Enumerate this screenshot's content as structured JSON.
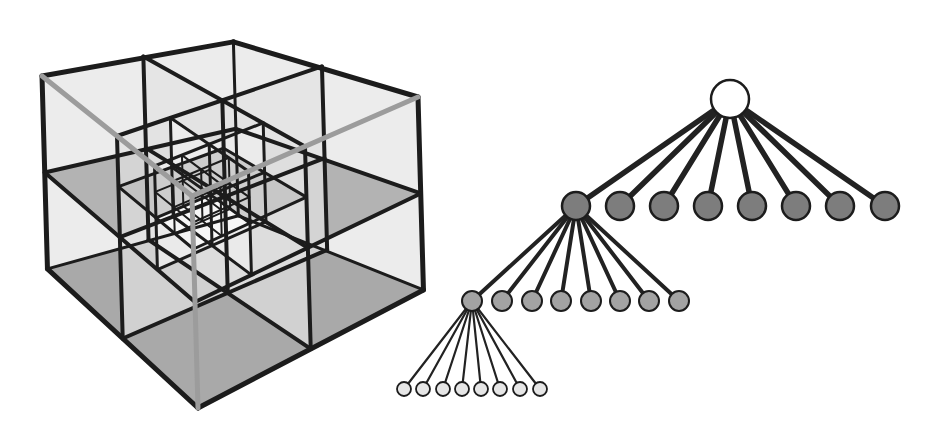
{
  "figure": {
    "colors": {
      "background": "#ffffff",
      "edge_dark": "#1c1c1c",
      "edge_hidden": "#9c9c9c",
      "face_light": "#ececec",
      "face_dark": "#a9a9a9",
      "root_fill": "#ffffff",
      "level1_fill": "#7d7d7d",
      "level2_fill": "#a3a3a3",
      "leaf_fill": "#e6e6e6"
    }
  },
  "cube": {
    "label": "octree-cube",
    "levels": 3,
    "corners": {
      "top_back": [
        241,
        20
      ],
      "left": [
        42,
        76
      ],
      "right": [
        418,
        97
      ],
      "front_top_hidden": [
        192,
        196
      ],
      "left_bottom": [
        78,
        272
      ],
      "right_bottom": [
        378,
        296
      ],
      "bottom": [
        198,
        408
      ]
    }
  },
  "tree": {
    "label": "octree-tree",
    "branching": 8,
    "root": {
      "x": 730,
      "y": 99,
      "r": 19
    },
    "level1": {
      "y": 206,
      "r": 14,
      "x": [
        576,
        620,
        664,
        708,
        752,
        796,
        840,
        885
      ],
      "expanded_index": 0
    },
    "level2": {
      "y": 301,
      "r": 10,
      "x": [
        472,
        502,
        532,
        561,
        591,
        620,
        649,
        679
      ],
      "expanded_index": 0
    },
    "leaves": {
      "y": 389,
      "r": 7,
      "x": [
        404,
        423,
        443,
        462,
        481,
        500,
        520,
        540
      ]
    }
  }
}
